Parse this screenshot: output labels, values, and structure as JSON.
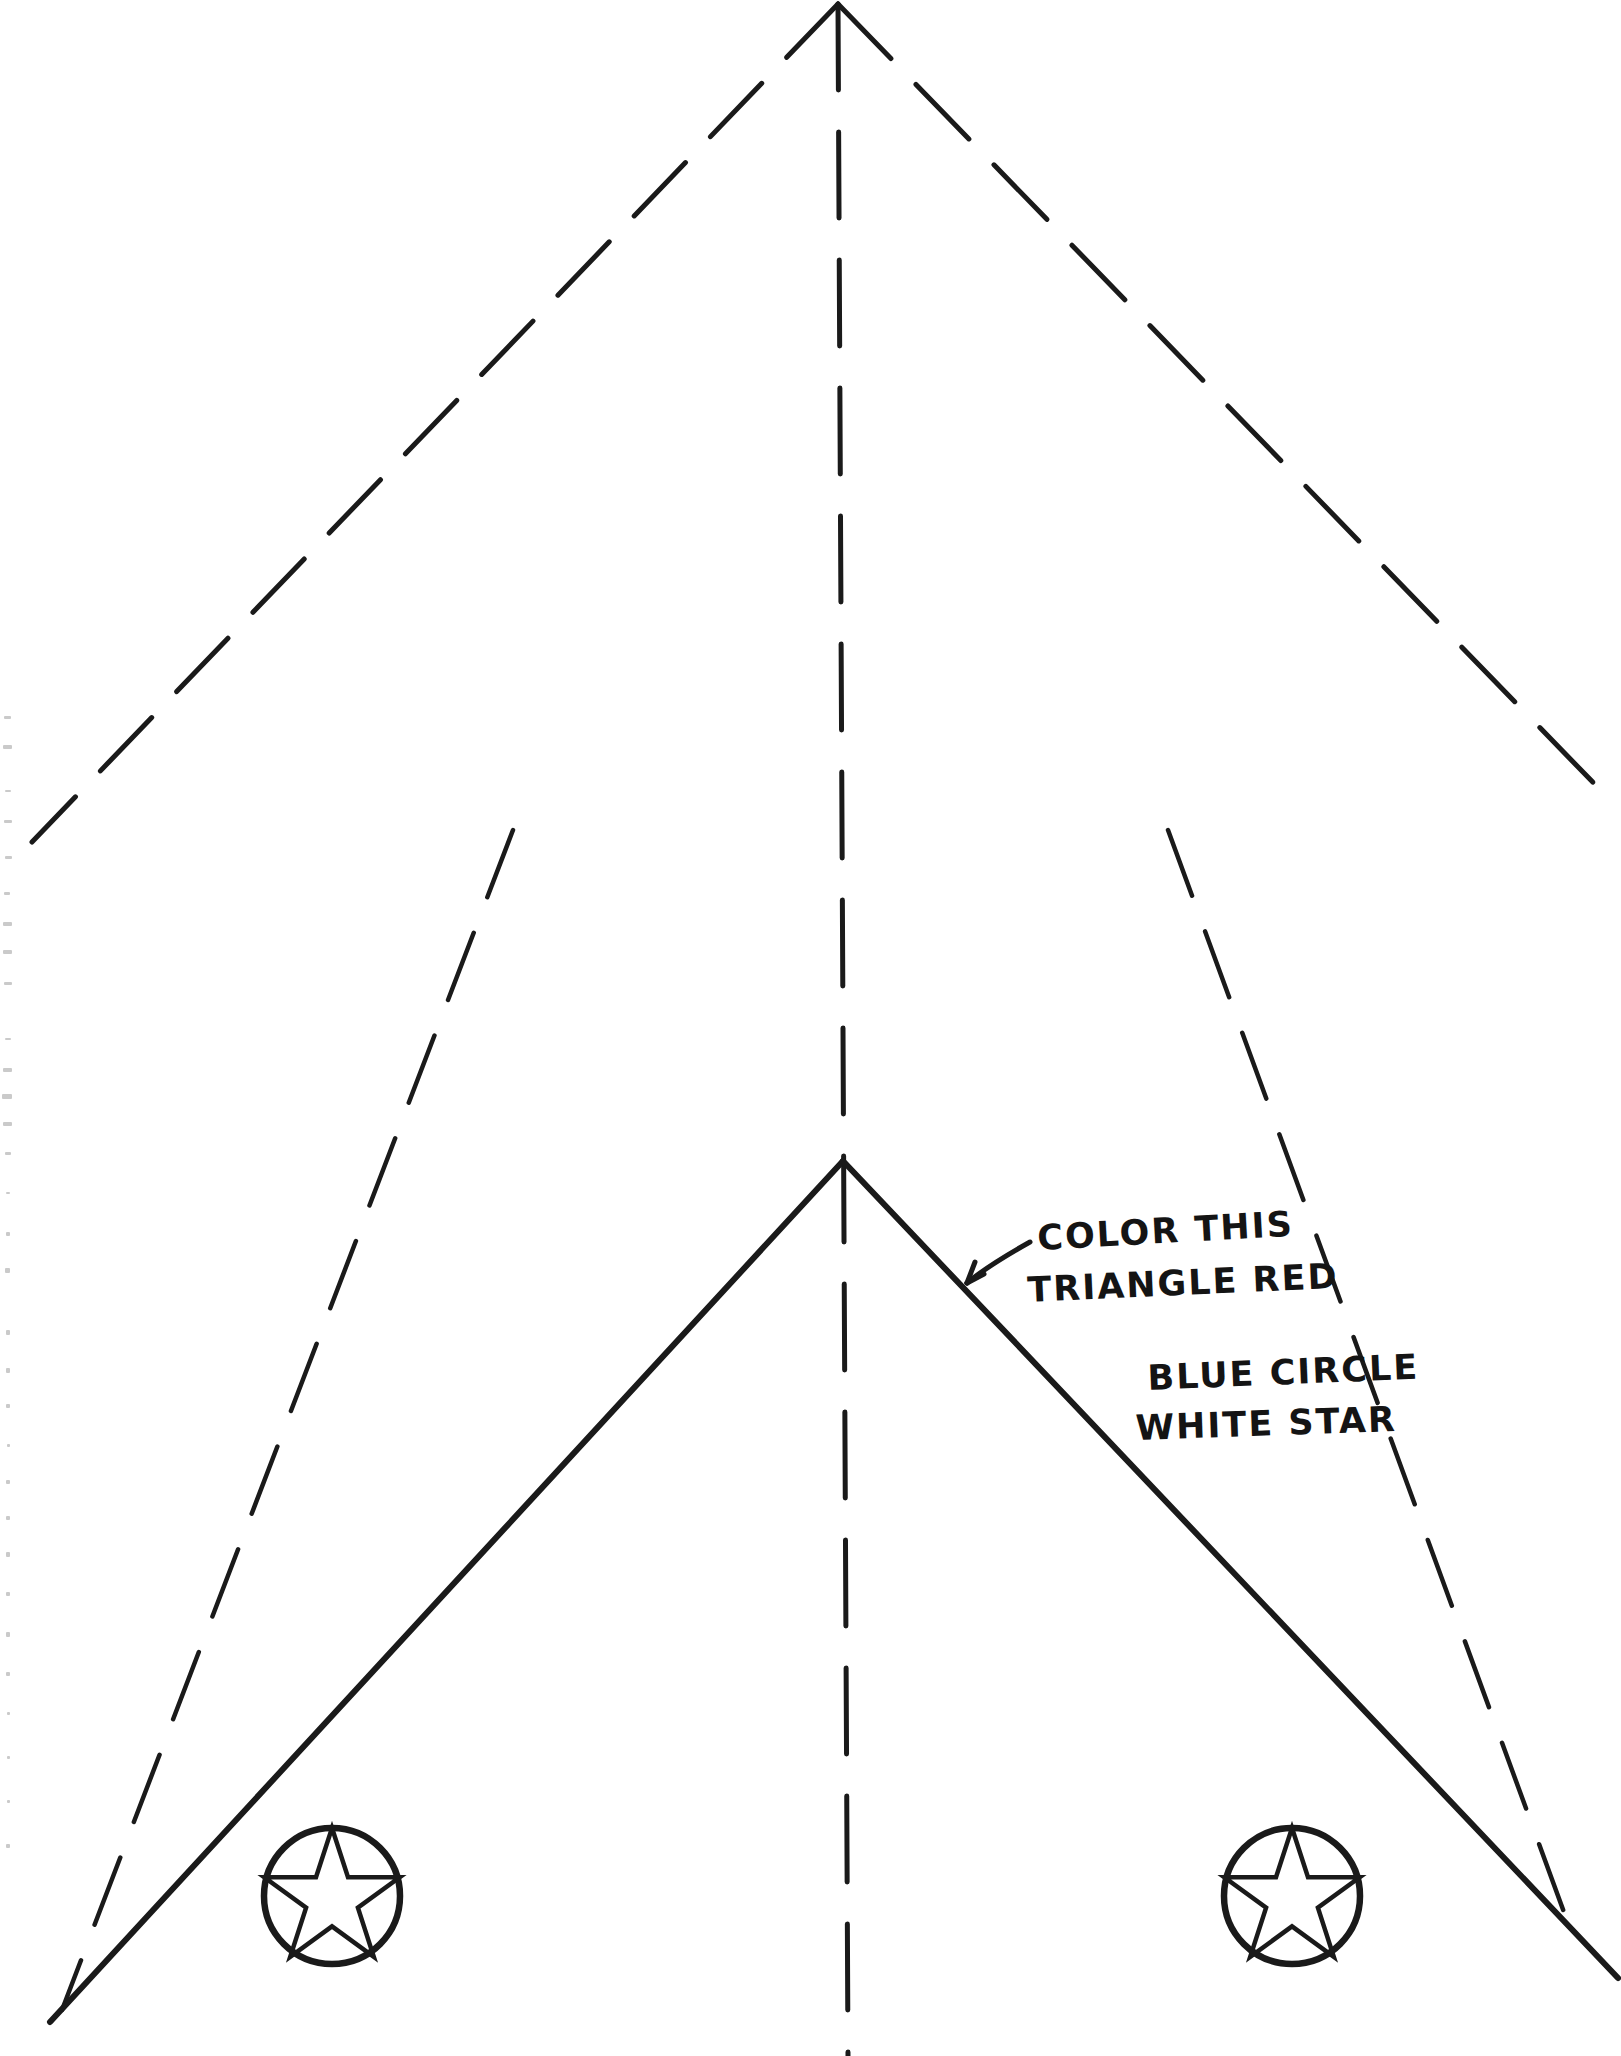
{
  "document": {
    "title": "Flag Craft Template",
    "type": "hand-drawn worksheet",
    "background_color": "#ffffff",
    "ink_color": "#1a1a1a",
    "width": 1621,
    "height": 2056
  },
  "annotations": [
    {
      "id": "red-triangle-note",
      "line1": "COLOR THIS",
      "line2": "TRIANGLE RED",
      "has_arrow": true,
      "arrow_points_to": "solid-triangle-right-edge"
    },
    {
      "id": "roundel-note",
      "line1": "BLUE CIRCLE",
      "line2": "WHITE STAR",
      "has_arrow": false
    }
  ],
  "shapes": {
    "solid_triangle": {
      "name": "solid-triangle",
      "style": "solid",
      "apex": [
        843,
        1161
      ],
      "left_corner": [
        50,
        2022
      ],
      "right_corner": [
        1618,
        1978
      ],
      "label": "triangle to be colored red"
    },
    "outer_dashed_chevron": {
      "name": "outer-dashed-chevron",
      "style": "dashed",
      "apex": [
        838,
        4
      ],
      "left_end": [
        32,
        842
      ],
      "right_end": [
        1612,
        802
      ]
    },
    "inner_dashed_chevron": {
      "name": "inner-dashed-chevron",
      "style": "dashed",
      "top_left": [
        513,
        830
      ],
      "bottom_left": [
        62,
        2010
      ],
      "top_right": [
        1168,
        830
      ],
      "bottom_right": [
        1576,
        1945
      ]
    },
    "center_fold_line": {
      "name": "center-fold-line",
      "style": "dashed",
      "top": [
        838,
        4
      ],
      "bottom": [
        848,
        2056
      ]
    },
    "roundels": [
      {
        "name": "roundel-left",
        "center": [
          332,
          1896
        ],
        "radius": 68,
        "star_points": 5,
        "circle_color_instruction": "blue",
        "star_color_instruction": "white"
      },
      {
        "name": "roundel-right",
        "center": [
          1292,
          1896
        ],
        "radius": 68,
        "star_points": 5,
        "circle_color_instruction": "blue",
        "star_color_instruction": "white"
      }
    ]
  },
  "scan_artifacts": {
    "name": "left-edge-speckles",
    "description": "faint dotted scanner marks along left margin"
  }
}
